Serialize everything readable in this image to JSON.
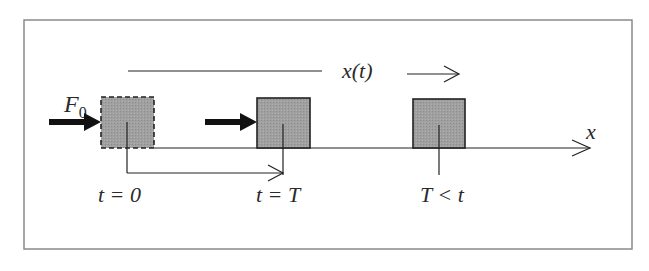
{
  "diagram": {
    "type": "physics-motion-diagram",
    "labels": {
      "force": "F",
      "force_subscript": "0",
      "position": "x(t)",
      "axis": "x",
      "time_start": "t = 0",
      "time_T": "t = T",
      "time_after": "T < t"
    },
    "blocks": [
      {
        "id": "block-t0",
        "style": "dashed",
        "has_force_arrow": true
      },
      {
        "id": "block-tT",
        "style": "solid",
        "has_force_arrow": true
      },
      {
        "id": "block-after",
        "style": "solid",
        "has_force_arrow": false
      }
    ],
    "colors": {
      "block_fill": "#9a9a9a",
      "line": "#222222",
      "frame": "#8a8a8a"
    }
  }
}
